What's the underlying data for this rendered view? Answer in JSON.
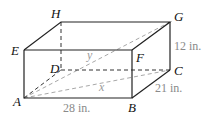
{
  "figure": {
    "type": "rectangular-prism",
    "vertices": {
      "A": {
        "label": "A",
        "x": 24,
        "y": 98
      },
      "B": {
        "label": "B",
        "x": 132,
        "y": 98
      },
      "C": {
        "label": "C",
        "x": 170,
        "y": 70
      },
      "D": {
        "label": "D",
        "x": 61,
        "y": 70
      },
      "E": {
        "label": "E",
        "x": 24,
        "y": 50
      },
      "F": {
        "label": "F",
        "x": 132,
        "y": 50
      },
      "G": {
        "label": "G",
        "x": 170,
        "y": 22
      },
      "H": {
        "label": "H",
        "x": 61,
        "y": 22
      }
    },
    "measurements": {
      "length": "28 in.",
      "width": "21 in.",
      "height": "12 in."
    },
    "diagonals": {
      "x": "x",
      "y": "y"
    },
    "colors": {
      "edge": "#222222",
      "hidden_edge": "#333333",
      "diagonal": "#a0a0a0",
      "measure_text": "#8a8a8a"
    }
  }
}
